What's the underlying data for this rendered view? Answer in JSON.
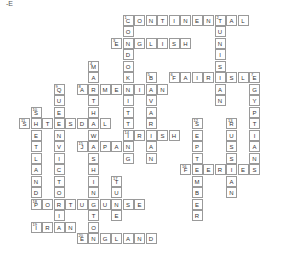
{
  "corner_text": "-E",
  "puzzle": {
    "entries": [
      {
        "number": 1,
        "direction": "across",
        "row": 0,
        "col": 10,
        "answer": "CONTINENTAL"
      },
      {
        "number": 2,
        "direction": "down",
        "row": 0,
        "col": 18,
        "answer": "TUNISIAN"
      },
      {
        "number": 1,
        "direction": "down",
        "row": 0,
        "col": 10,
        "answer": "CONDOKNITTING"
      },
      {
        "number": 3,
        "direction": "across",
        "row": 2,
        "col": 9,
        "answer": "ENGLISH"
      },
      {
        "number": 4,
        "direction": "down",
        "row": 4,
        "col": 7,
        "answer": "MARTHAWASHINGTON"
      },
      {
        "number": 5,
        "direction": "down",
        "row": 5,
        "col": 12,
        "answer": "BAVARIAN"
      },
      {
        "number": 6,
        "direction": "across",
        "row": 5,
        "col": 14,
        "answer": "FAIRISLE"
      },
      {
        "number": 7,
        "direction": "down",
        "row": 5,
        "col": 21,
        "answer": "EGYPTIANS"
      },
      {
        "number": 8,
        "direction": "across",
        "row": 6,
        "col": 6,
        "answer": "ARMENIAN"
      },
      {
        "number": 9,
        "direction": "down",
        "row": 6,
        "col": 4,
        "answer": "QUEENVICTORIA"
      },
      {
        "number": 10,
        "direction": "down",
        "row": 8,
        "col": 2,
        "answer": "SHETLAND"
      },
      {
        "number": 11,
        "direction": "across",
        "row": 9,
        "col": 1,
        "answer": "SETESDAL"
      },
      {
        "number": 12,
        "direction": "down",
        "row": 9,
        "col": 16,
        "answer": "SEPTEMBER"
      },
      {
        "number": 13,
        "direction": "down",
        "row": 9,
        "col": 19,
        "answer": "RUSSIAN"
      },
      {
        "number": 14,
        "direction": "across",
        "row": 10,
        "col": 10,
        "answer": "IRISH"
      },
      {
        "number": 15,
        "direction": "across",
        "row": 11,
        "col": 6,
        "answer": "JAPAN"
      },
      {
        "number": 16,
        "direction": "across",
        "row": 13,
        "col": 15,
        "answer": "FEERIES"
      },
      {
        "number": 17,
        "direction": "down",
        "row": 14,
        "col": 9,
        "answer": "TUNE"
      },
      {
        "number": 18,
        "direction": "across",
        "row": 16,
        "col": 2,
        "answer": "PORTUGUESE"
      },
      {
        "number": 19,
        "direction": "across",
        "row": 18,
        "col": 2,
        "answer": "IRAN"
      },
      {
        "number": 20,
        "direction": "across",
        "row": 19,
        "col": 6,
        "answer": "ENGLAND"
      }
    ]
  }
}
